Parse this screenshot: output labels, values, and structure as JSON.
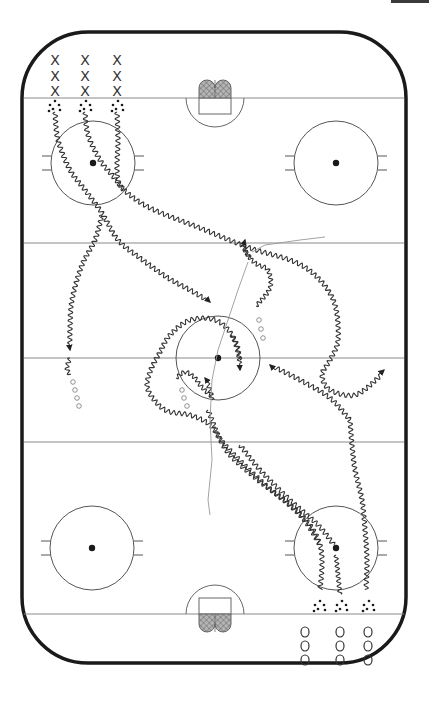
{
  "diagram": {
    "type": "ice-rink-drill",
    "colors": {
      "board": "#1a1a1a",
      "lines": "#8a8a8a",
      "path": "#333333",
      "dot": "#1a1a1a",
      "net_fill": "#9a9a9a",
      "corner_tab": "#3a3a3a"
    },
    "rink": {
      "x": 22,
      "y": 32,
      "width": 384,
      "height": 631,
      "corner_radius": 66,
      "goal_lines_y": [
        98,
        614
      ],
      "blue_lines_y": [
        243,
        442
      ],
      "center_line_y": 358
    },
    "faceoff_circles": [
      {
        "name": "top-left",
        "cx": 93,
        "cy": 163,
        "r": 42
      },
      {
        "name": "top-right",
        "cx": 336,
        "cy": 163,
        "r": 42
      },
      {
        "name": "center",
        "cx": 218,
        "cy": 358,
        "r": 42
      },
      {
        "name": "bottom-left",
        "cx": 92,
        "cy": 548,
        "r": 42
      },
      {
        "name": "bottom-right",
        "cx": 336,
        "cy": 548,
        "r": 42
      }
    ],
    "nets": [
      {
        "name": "top-net",
        "cx": 215,
        "goal_line_y": 98,
        "side": "top"
      },
      {
        "name": "bottom-net",
        "cx": 215,
        "goal_line_y": 614,
        "side": "bottom"
      }
    ],
    "players": {
      "x_group": {
        "symbol": "X",
        "columns_x": [
          55,
          85,
          117
        ],
        "rows_y": [
          60,
          76,
          91
        ]
      },
      "o_group": {
        "symbol": "O",
        "columns_x": [
          305,
          340,
          368
        ],
        "rows_y": [
          632,
          646,
          660
        ]
      }
    },
    "puck_piles": [
      {
        "name": "top-pucks",
        "columns_x": [
          55,
          86,
          118
        ],
        "y": 106
      },
      {
        "name": "bottom-pucks",
        "columns_x": [
          320,
          342,
          369
        ],
        "y": 606
      }
    ],
    "legend": {
      "x_label": "X",
      "o_label": "O"
    }
  }
}
